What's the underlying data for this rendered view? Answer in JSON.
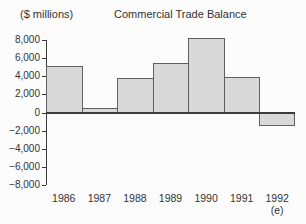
{
  "header": {
    "units_label": "($ millions)",
    "title": "Commercial Trade Balance"
  },
  "chart_data": {
    "type": "bar",
    "title": "Commercial Trade Balance",
    "ylabel": "($ millions)",
    "xlabel": "",
    "categories": [
      "1986",
      "1987",
      "1988",
      "1989",
      "1990",
      "1991",
      "1992"
    ],
    "values": [
      5100,
      500,
      3800,
      5500,
      8200,
      3900,
      -1500
    ],
    "category_note": {
      "index": 6,
      "label": "(e)"
    },
    "ylim": [
      -8000,
      8000
    ],
    "ytick_step": 2000,
    "ytick_labels": [
      "8,000",
      "6,000",
      "4,000",
      "2,000",
      "0",
      "−2,000",
      "−4,000",
      "−6,000",
      "−8,000"
    ],
    "grid": false,
    "legend_position": "none",
    "colors": {
      "bar_fill": "#d9d9d9",
      "bar_border": "#5f5f5f",
      "axis": "#3c3c3c",
      "text": "#333333",
      "background": "#fcfcfc"
    }
  }
}
